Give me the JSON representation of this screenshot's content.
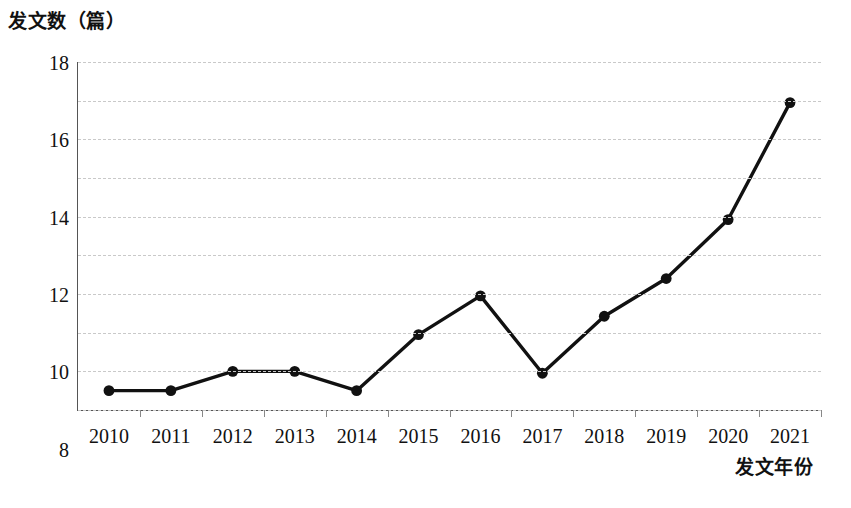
{
  "chart_data": {
    "type": "line",
    "title": "",
    "subtitle": "",
    "ylabel": "发文数（篇）",
    "xlabel": "发文年份",
    "categories": [
      "2010",
      "2011",
      "2012",
      "2013",
      "2014",
      "2015",
      "2016",
      "2017",
      "2018",
      "2019",
      "2020",
      "2021"
    ],
    "x": [
      2010,
      2011,
      2012,
      2013,
      2014,
      2015,
      2016,
      2017,
      2018,
      2019,
      2020,
      2021
    ],
    "values": [
      1,
      1,
      2,
      2,
      1,
      3.9,
      5.9,
      1.9,
      4.85,
      6.8,
      9.85,
      15.9
    ],
    "series": [
      {
        "name": "发文数",
        "values": [
          1,
          1,
          2,
          2,
          1,
          3.9,
          5.9,
          1.9,
          4.85,
          6.8,
          9.85,
          15.9
        ]
      }
    ],
    "ylim": [
      0,
      18
    ],
    "yticks": [
      0,
      2,
      4,
      6,
      8,
      10,
      12,
      14,
      16,
      18
    ],
    "ytick_labels": [
      "0",
      "2",
      "4",
      "6",
      "8",
      "10",
      "12",
      "14",
      "16",
      "18"
    ],
    "grid": true,
    "grid_axis": "y",
    "grid_style": "dashed",
    "legend": false,
    "legend_position": "none",
    "marker": "filled-circle",
    "line_color": "#111111",
    "marker_color": "#111111",
    "grid_color": "#c9c9c9",
    "axis_color": "#555555",
    "background": "#ffffff"
  }
}
